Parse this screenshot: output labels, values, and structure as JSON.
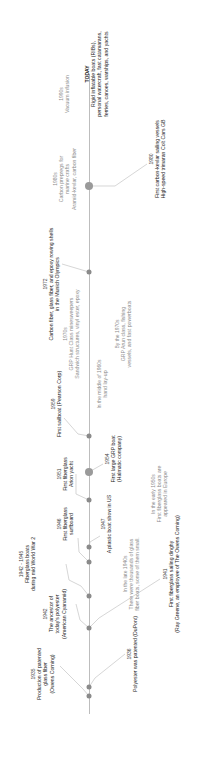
{
  "timeline": {
    "title": "Fiberglass and composite boats timeline",
    "axis_color": "#bdbdbd",
    "dot_color": "#8a8a8a",
    "events": [
      {
        "id": "e1935",
        "year": "1935",
        "lines": [
          "Production of patented",
          "glass fiber",
          "(Owens Corning)"
        ],
        "side": "above",
        "style": "dark"
      },
      {
        "id": "e1936",
        "year": "1936",
        "lines": [
          "Polyester was patented (DuPont)"
        ],
        "side": "below",
        "style": "dark"
      },
      {
        "id": "e1941",
        "year": "1941",
        "lines": [
          "First fiberglass sailing dinghy",
          "(Ray Greene, an employee of The Owens Corning)"
        ],
        "side": "below",
        "style": "dark"
      },
      {
        "id": "e1942",
        "year": "1942",
        "lines": [
          "The ancestor of",
          "today's polyester",
          "(American Cyanamid)"
        ],
        "side": "above",
        "style": "dark"
      },
      {
        "id": "e1942_45",
        "year": "1942 - 1945",
        "lines": [
          "Fiberglass boats",
          "during mid World War 2"
        ],
        "side": "above",
        "style": "dark"
      },
      {
        "id": "e1940s",
        "year": "In the late 1940s",
        "lines": [
          "There were thousands of glass",
          "fiber boats, some of them small."
        ],
        "side": "below",
        "style": "light"
      },
      {
        "id": "e1946",
        "year": "1946",
        "lines": [
          "First fiberglass",
          "surfboard"
        ],
        "side": "above",
        "style": "dark"
      },
      {
        "id": "e1947",
        "year": "1947",
        "lines": [
          "A plastic boat show in US"
        ],
        "side": "below",
        "style": "dark"
      },
      {
        "id": "e1950s",
        "year": "In the early 1950s",
        "lines": [
          "First fiberglass boats are",
          "appeared in Europe"
        ],
        "side": "below",
        "style": "light"
      },
      {
        "id": "e1951",
        "year": "1951",
        "lines": [
          "First fiberglass",
          "Arion yacht"
        ],
        "side": "above",
        "style": "dark"
      },
      {
        "id": "e1954",
        "year": "1954",
        "lines": [
          "First large GRP boat",
          "(Halmatic company)"
        ],
        "side": "below",
        "style": "dark"
      },
      {
        "id": "e1959",
        "year": "1959",
        "lines": [
          "First sailboat (Pearson Corp)"
        ],
        "side": "above",
        "style": "dark"
      },
      {
        "id": "e1960s",
        "year": "In the middle of 1960s",
        "lines": [
          "hand lay-up"
        ],
        "side": "below",
        "style": "light"
      },
      {
        "id": "e1970s_a",
        "year": "1970s",
        "lines": [
          "GRP Hunt Class minesweepers",
          "Sandwich structures, vinyl ester, epoxy"
        ],
        "side": "above",
        "style": "light"
      },
      {
        "id": "e1970s_b",
        "year": "By the 1970s",
        "lines": [
          "GRP Arun class, fishing",
          "vessels, and fast powerboats"
        ],
        "side": "below",
        "style": "light"
      },
      {
        "id": "e1972",
        "year": "1972",
        "lines": [
          "Carbon fiber, glass fiber, and epoxy rowing shells",
          "in the Munich Olympics"
        ],
        "side": "above",
        "style": "dark"
      },
      {
        "id": "e1980s",
        "year": "1980s",
        "lines": [
          "Carbon prepregs for",
          "marine crafts",
          "Aramid-kevlar, carbon fiber"
        ],
        "side": "above",
        "style": "light"
      },
      {
        "id": "e1980",
        "year": "1980",
        "lines": [
          "First carbon-kevlar sailing vessels",
          "High-speed trimaran Colt Cars GB"
        ],
        "side": "below",
        "style": "dark"
      },
      {
        "id": "e1990s",
        "year": "1990s",
        "lines": [
          "Vacuum infusion"
        ],
        "side": "above",
        "style": "light"
      },
      {
        "id": "etoday",
        "year": "TODAY",
        "lines": [
          "Rigid inflatable boats (RIBs),",
          "personal watercraft, fast catamarans,",
          "ferries, canoes, warships, and yachts"
        ],
        "side": "below",
        "style": "dark"
      }
    ]
  }
}
